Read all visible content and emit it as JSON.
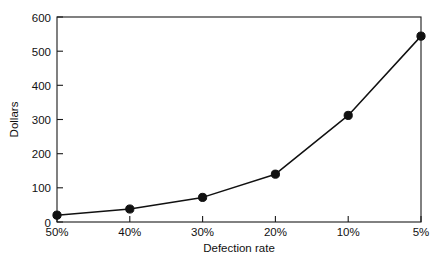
{
  "chart_data": {
    "type": "line",
    "title": "",
    "xlabel": "Defection rate",
    "ylabel": "Dollars",
    "categories": [
      "50%",
      "40%",
      "30%",
      "20%",
      "10%",
      "5%"
    ],
    "values": [
      20,
      38,
      72,
      140,
      312,
      544
    ],
    "series": [
      {
        "name": "Dollars",
        "values": [
          20,
          38,
          72,
          140,
          312,
          544
        ]
      }
    ],
    "ylim": [
      0,
      600
    ],
    "yticks": [
      0,
      100,
      200,
      300,
      400,
      500,
      600
    ],
    "ytick_labels": [
      "0",
      "100",
      "200",
      "300",
      "400",
      "500",
      "600"
    ],
    "xtick_labels": [
      "50%",
      "40%",
      "30%",
      "20%",
      "10%",
      "5%"
    ],
    "grid": false,
    "legend": false,
    "marker": "filled-circle",
    "line_color": "#111111",
    "marker_color": "#111111",
    "background_color": "#ffffff",
    "frame": "box"
  },
  "axes": {
    "y_title": "Dollars",
    "x_title": "Defection rate",
    "y_tick_0": "0",
    "y_tick_1": "100",
    "y_tick_2": "200",
    "y_tick_3": "300",
    "y_tick_4": "400",
    "y_tick_5": "500",
    "y_tick_6": "600",
    "x_tick_0": "50%",
    "x_tick_1": "40%",
    "x_tick_2": "30%",
    "x_tick_3": "20%",
    "x_tick_4": "10%",
    "x_tick_5": "5%"
  }
}
